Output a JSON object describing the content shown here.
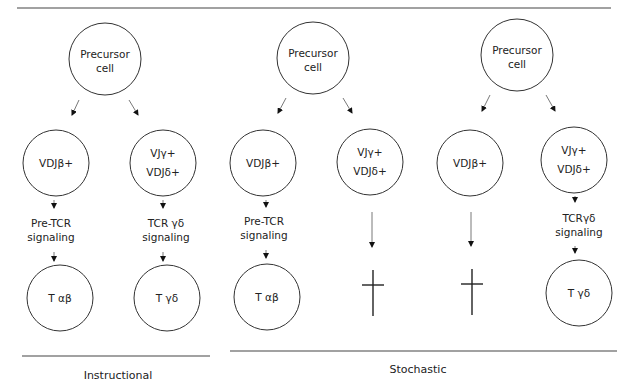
{
  "figure": {
    "panels": [
      {
        "id": "instructional",
        "precursor": [
          "Precursor",
          "cell"
        ],
        "branches": [
          {
            "cell": [
              "VDJβ+"
            ],
            "signal": [
              "Pre-TCR",
              "signaling"
            ],
            "outcome": "T αβ"
          },
          {
            "cell": [
              "VJγ+",
              "VDJδ+"
            ],
            "signal": [
              "TCR γδ",
              "signaling"
            ],
            "outcome": "T γδ"
          }
        ]
      },
      {
        "id": "stochastic-1",
        "precursor": [
          "Precursor",
          "cell"
        ],
        "branches": [
          {
            "cell": [
              "VDJβ+"
            ],
            "signal": [
              "Pre-TCR",
              "signaling"
            ],
            "outcome": "T αβ"
          },
          {
            "cell": [
              "VJγ+",
              "VDJδ+"
            ],
            "signal": [],
            "outcome": "death (cross)"
          }
        ]
      },
      {
        "id": "stochastic-2",
        "precursor": [
          "Precursor",
          "cell"
        ],
        "branches": [
          {
            "cell": [
              "VDJβ+"
            ],
            "signal": [],
            "outcome": "death (cross)"
          },
          {
            "cell": [
              "VJγ+",
              "VDJδ+"
            ],
            "signal": [
              "TCRγδ",
              "signaling"
            ],
            "outcome": "T γδ"
          }
        ]
      }
    ],
    "labels": {
      "instructional": "Instructional",
      "stochastic": "Stochastic"
    },
    "text": {
      "p1_pre1": "Precursor",
      "p1_pre2": "cell",
      "p1_b1": "VDJβ+",
      "p1_b2a": "VJγ+",
      "p1_b2b": "VDJδ+",
      "p1_s1a": "Pre-TCR",
      "p1_s1b": "signaling",
      "p1_s2a": "TCR γδ",
      "p1_s2b": "signaling",
      "p1_o1": "T αβ",
      "p1_o2": "T γδ",
      "p2_pre1": "Precursor",
      "p2_pre2": "cell",
      "p2_b1": "VDJβ+",
      "p2_b2a": "VJγ+",
      "p2_b2b": "VDJδ+",
      "p2_s1a": "Pre-TCR",
      "p2_s1b": "signaling",
      "p2_o1": "T αβ",
      "p3_pre1": "Precursor",
      "p3_pre2": "cell",
      "p3_b1": "VDJβ+",
      "p3_b2a": "VJγ+",
      "p3_b2b": "VDJδ+",
      "p3_s2a": "TCRγδ",
      "p3_s2b": "signaling",
      "p3_o2": "T γδ"
    }
  }
}
